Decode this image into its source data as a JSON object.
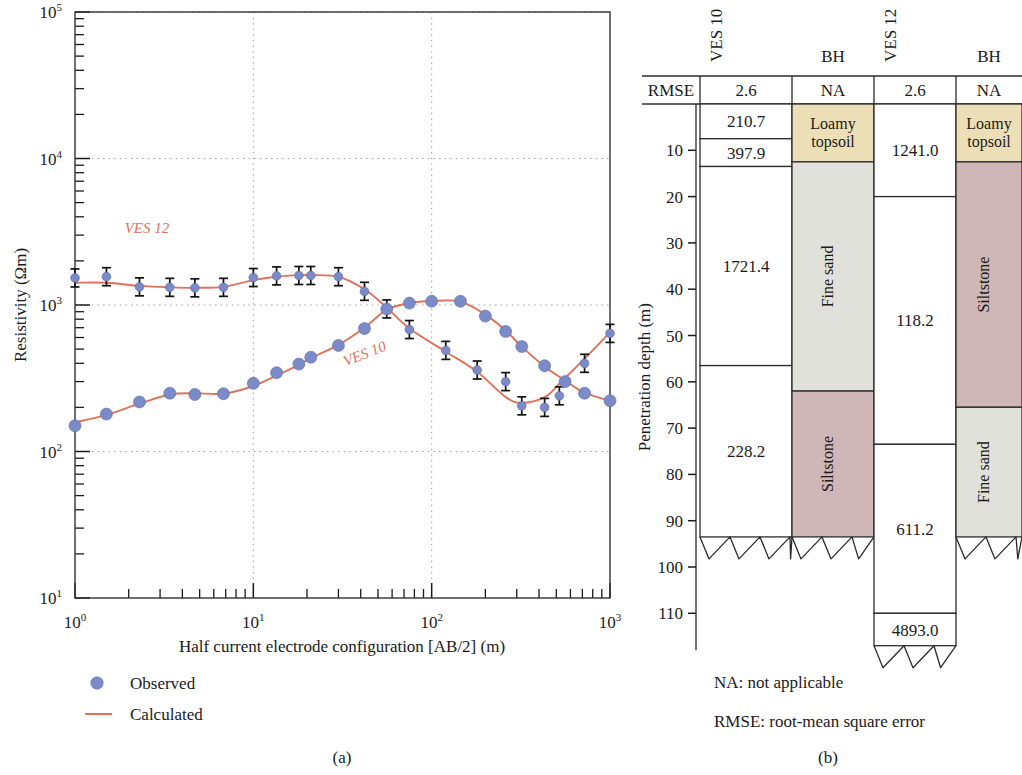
{
  "figure": {
    "panel_a_caption": "(a)",
    "panel_b_caption": "(b)"
  },
  "chart_data": [
    {
      "type": "line",
      "title": "",
      "xlabel": "Half current electrode configuration [AB/2] (m)",
      "ylabel": "Resistivity (Ωm)",
      "xscale": "log",
      "yscale": "log",
      "xlim": [
        1,
        1000
      ],
      "ylim": [
        10,
        100000
      ],
      "xticks": [
        "10^0",
        "10^1",
        "10^2",
        "10^3"
      ],
      "yticks": [
        "10^1",
        "10^2",
        "10^3",
        "10^4",
        "10^5"
      ],
      "grid": true,
      "legend": [
        {
          "label": "Observed",
          "marker": "circle",
          "color": "#7b8bc8"
        },
        {
          "label": "Calculated",
          "marker": "line",
          "color": "#e0715a"
        }
      ],
      "annotations": [
        {
          "text": "VES 12",
          "x": 1.9,
          "y": 3100
        },
        {
          "text": "VES 10",
          "x": 33,
          "y": 380
        }
      ],
      "series": [
        {
          "name": "VES 12",
          "kind": "observed",
          "color": "#7b8bc8",
          "x": [
            1.0,
            1.5,
            2.3,
            3.4,
            4.7,
            6.8,
            10.0,
            13.5,
            18.0,
            21.0,
            30.0,
            42.0,
            56.0,
            75.0,
            120.0,
            180.0,
            260.0,
            320.0,
            430.0,
            520.0,
            720.0,
            1000.0
          ],
          "y": [
            1530,
            1560,
            1330,
            1320,
            1310,
            1320,
            1540,
            1580,
            1590,
            1590,
            1560,
            1240,
            940,
            680,
            490,
            360,
            300,
            205,
            200,
            240,
            400,
            640
          ]
        },
        {
          "name": "VES 12",
          "kind": "calculated",
          "color": "#e0715a",
          "x": [
            1.0,
            1.5,
            2.3,
            3.4,
            4.7,
            6.8,
            10.0,
            13.5,
            18.0,
            21.0,
            30.0,
            42.0,
            56.0,
            75.0,
            120.0,
            180.0,
            260.0,
            320.0,
            430.0,
            520.0,
            720.0,
            1000.0
          ],
          "y": [
            1420,
            1420,
            1350,
            1320,
            1310,
            1330,
            1480,
            1560,
            1600,
            1600,
            1560,
            1280,
            960,
            690,
            480,
            350,
            235,
            215,
            235,
            290,
            430,
            650
          ]
        },
        {
          "name": "VES 10",
          "kind": "observed",
          "color": "#7b8bc8",
          "x": [
            1.0,
            1.5,
            2.3,
            3.4,
            4.7,
            6.8,
            10.0,
            13.5,
            18.0,
            21.0,
            30.0,
            42.0,
            56.0,
            75.0,
            100.0,
            145.0,
            200.0,
            260.0,
            320.0,
            430.0,
            560.0,
            720.0,
            1000.0
          ],
          "y": [
            150,
            180,
            218,
            250,
            245,
            248,
            292,
            345,
            395,
            440,
            530,
            690,
            940,
            1030,
            1060,
            1060,
            840,
            660,
            520,
            385,
            300,
            250,
            222
          ]
        },
        {
          "name": "VES 10",
          "kind": "calculated",
          "color": "#e0715a",
          "x": [
            1.0,
            1.5,
            2.3,
            3.4,
            4.7,
            6.8,
            10.0,
            13.5,
            18.0,
            21.0,
            30.0,
            42.0,
            56.0,
            75.0,
            100.0,
            145.0,
            200.0,
            260.0,
            320.0,
            430.0,
            560.0,
            720.0,
            1000.0
          ],
          "y": [
            158,
            178,
            212,
            245,
            250,
            248,
            280,
            330,
            390,
            435,
            535,
            700,
            930,
            1030,
            1065,
            1055,
            860,
            670,
            520,
            380,
            305,
            252,
            222
          ]
        }
      ]
    }
  ],
  "panel_b": {
    "depth_axis": {
      "label": "Penetration depth (m)",
      "ticks": [
        10,
        20,
        30,
        40,
        50,
        60,
        70,
        80,
        90,
        100,
        110
      ],
      "max_depth": 118
    },
    "row_label": "RMSE",
    "columns": [
      {
        "header": "VES 10",
        "header_orientation": "vertical",
        "rmse": "2.6",
        "kind": "ves",
        "layers": [
          {
            "value": "210.7",
            "top": 0,
            "bottom": 7.5
          },
          {
            "value": "397.9",
            "top": 7.5,
            "bottom": 13.5
          },
          {
            "value": "1721.4",
            "top": 13.5,
            "bottom": 56.5
          },
          {
            "value": "228.2",
            "top": 56.5,
            "bottom": 93.5
          }
        ],
        "bottom_serrated": true
      },
      {
        "header": "BH",
        "header_orientation": "horizontal",
        "rmse": "NA",
        "kind": "bh",
        "layers": [
          {
            "value": "Loamy topsoil",
            "top": 0,
            "bottom": 12.5,
            "fill": "#ecdfb8"
          },
          {
            "value": "Fine sand",
            "top": 12.5,
            "bottom": 62.0,
            "fill": "#dfe1da"
          },
          {
            "value": "Siltstone",
            "top": 62.0,
            "bottom": 93.5,
            "fill": "#cfb7b7"
          }
        ],
        "bottom_serrated": true
      },
      {
        "header": "VES 12",
        "header_orientation": "vertical",
        "rmse": "2.6",
        "kind": "ves",
        "layers": [
          {
            "value": "1241.0",
            "top": 0,
            "bottom": 20.0
          },
          {
            "value": "118.2",
            "top": 20.0,
            "bottom": 73.5
          },
          {
            "value": "611.2",
            "top": 73.5,
            "bottom": 110.0
          },
          {
            "value": "4893.0",
            "top": 110.0,
            "bottom": 117.0
          }
        ],
        "bottom_serrated": true
      },
      {
        "header": "BH",
        "header_orientation": "horizontal",
        "rmse": "NA",
        "kind": "bh",
        "layers": [
          {
            "value": "Loamy topsoil",
            "top": 0,
            "bottom": 12.5,
            "fill": "#ecdfb8"
          },
          {
            "value": "Siltstone",
            "top": 12.5,
            "bottom": 65.5,
            "fill": "#cfb7b7"
          },
          {
            "value": "Fine sand",
            "top": 65.5,
            "bottom": 93.5,
            "fill": "#dfe1da"
          }
        ],
        "bottom_serrated": true
      }
    ],
    "notes": [
      "NA: not applicable",
      "RMSE: root-mean square error"
    ]
  }
}
